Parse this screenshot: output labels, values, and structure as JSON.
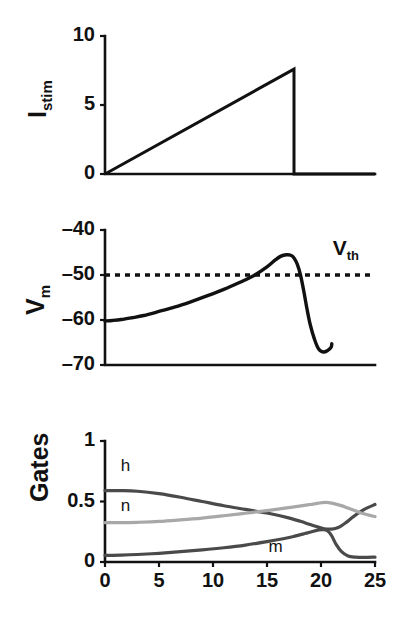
{
  "figure": {
    "background": "#ffffff",
    "axis_color": "#111111"
  },
  "chart_data": [
    {
      "type": "line",
      "name": "stimulus-current",
      "title": "",
      "ylabel": "I",
      "ylabel_sub": "stim",
      "xlabel": "",
      "xlim": [
        0,
        25
      ],
      "ylim": [
        0,
        10
      ],
      "yticks": [
        0,
        5,
        10
      ],
      "ytick_labels": [
        "0",
        "5",
        "10"
      ],
      "xticks": [],
      "grid": false,
      "legend": "none",
      "series": [
        {
          "name": "I_stim",
          "color": "#111111",
          "x": [
            0,
            17.5,
            17.5,
            25
          ],
          "values": [
            0,
            7.6,
            0,
            0
          ]
        }
      ]
    },
    {
      "type": "line",
      "name": "membrane-voltage",
      "title": "",
      "ylabel": "V",
      "ylabel_sub": "m",
      "xlabel": "",
      "xlim": [
        0,
        25
      ],
      "ylim": [
        -70,
        -40
      ],
      "yticks": [
        -70,
        -60,
        -50,
        -40
      ],
      "ytick_labels": [
        "–70",
        "–60",
        "–50",
        "–40"
      ],
      "xticks": [],
      "grid": false,
      "legend": "none",
      "annotations": [
        {
          "name": "threshold",
          "label": "V",
          "label_sub": "th",
          "value": -50,
          "style": "dashed-horizontal",
          "color": "#111111",
          "label_x": 22.3,
          "label_y": -45.6
        }
      ],
      "series": [
        {
          "name": "V_m",
          "color": "#111111",
          "x": [
            0,
            0.7,
            1.5,
            2.5,
            3.6,
            5.0,
            6.5,
            8.0,
            9.5,
            11.0,
            12.5,
            13.8,
            15.0,
            15.8,
            16.3,
            16.8,
            17.2,
            17.5,
            17.8,
            18.1,
            18.4,
            18.7,
            19.0,
            19.4,
            19.8,
            20.3,
            20.9,
            21.0
          ],
          "values": [
            -60.2,
            -60.1,
            -59.9,
            -59.5,
            -59.0,
            -58.1,
            -57.1,
            -55.9,
            -54.6,
            -53.2,
            -51.6,
            -50.1,
            -48.2,
            -46.6,
            -45.8,
            -45.5,
            -45.6,
            -46.2,
            -47.6,
            -50.0,
            -53.5,
            -57.5,
            -61.0,
            -64.3,
            -66.5,
            -67.1,
            -66.2,
            -65.3
          ]
        }
      ]
    },
    {
      "type": "line",
      "name": "gating-variables",
      "title": "",
      "ylabel": "Gates",
      "ylabel_sub": "",
      "xlabel": "",
      "xlim": [
        0,
        25
      ],
      "ylim": [
        0,
        1
      ],
      "yticks": [
        0,
        0.5,
        1
      ],
      "ytick_labels": [
        "0",
        "0.5",
        "1"
      ],
      "xticks": [
        0,
        5,
        10,
        15,
        20,
        25
      ],
      "xtick_labels": [
        "0",
        "5",
        "10",
        "15",
        "20",
        "25"
      ],
      "grid": false,
      "legend": "inline-labels",
      "series": [
        {
          "name": "h",
          "label": "h",
          "color": "#4a4a4a",
          "label_x": 1.9,
          "label_y": 0.75,
          "x": [
            0,
            1.5,
            3.0,
            5.0,
            7.0,
            9.0,
            11.0,
            13.0,
            15.0,
            17.0,
            18.5,
            19.5,
            20.3,
            21.0,
            21.6,
            22.3,
            23.0,
            24.0,
            25.0
          ],
          "values": [
            0.59,
            0.59,
            0.585,
            0.565,
            0.535,
            0.5,
            0.465,
            0.435,
            0.405,
            0.365,
            0.325,
            0.295,
            0.275,
            0.272,
            0.285,
            0.325,
            0.375,
            0.435,
            0.475
          ]
        },
        {
          "name": "n",
          "label": "n",
          "color": "#a8a8a8",
          "label_x": 1.9,
          "label_y": 0.42,
          "x": [
            0,
            1.5,
            3.0,
            5.0,
            7.0,
            9.0,
            11.0,
            13.0,
            15.0,
            16.5,
            18.0,
            19.0,
            19.8,
            20.4,
            21.0,
            21.8,
            22.6,
            23.5,
            24.3,
            25.0
          ],
          "values": [
            0.325,
            0.325,
            0.328,
            0.335,
            0.348,
            0.363,
            0.382,
            0.403,
            0.425,
            0.443,
            0.462,
            0.475,
            0.487,
            0.492,
            0.487,
            0.468,
            0.442,
            0.412,
            0.39,
            0.375
          ]
        },
        {
          "name": "m",
          "label": "m",
          "color": "#4a4a4a",
          "label_x": 15.8,
          "label_y": 0.085,
          "x": [
            0,
            1.5,
            3.0,
            5.0,
            7.0,
            9.0,
            11.0,
            13.0,
            15.0,
            16.5,
            17.5,
            18.5,
            19.2,
            19.8,
            20.2,
            20.6,
            21.0,
            21.4,
            21.9,
            22.5,
            23.2,
            24.0,
            25.0
          ],
          "values": [
            0.055,
            0.057,
            0.062,
            0.072,
            0.085,
            0.1,
            0.118,
            0.14,
            0.168,
            0.192,
            0.212,
            0.235,
            0.252,
            0.265,
            0.268,
            0.258,
            0.215,
            0.145,
            0.085,
            0.05,
            0.04,
            0.038,
            0.04
          ]
        }
      ]
    }
  ]
}
